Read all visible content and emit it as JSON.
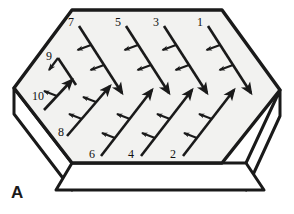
{
  "figure": {
    "panel_label": "A",
    "title": "",
    "shape": "hexagonal slab, 3D perspective",
    "fill_color": "#f2f2f0",
    "outline_color": "#1a1a1a",
    "arrow_color": "#1a1a1a",
    "background_color": "#ffffff"
  },
  "labels": [
    {
      "id": "1",
      "text": "1",
      "x": 200,
      "y": 26,
      "direction": "down-right"
    },
    {
      "id": "2",
      "text": "2",
      "x": 173,
      "y": 158,
      "direction": "up-right"
    },
    {
      "id": "3",
      "text": "3",
      "x": 156,
      "y": 26,
      "direction": "down-right"
    },
    {
      "id": "4",
      "text": "4",
      "x": 131,
      "y": 158,
      "direction": "up-right"
    },
    {
      "id": "5",
      "text": "5",
      "x": 118,
      "y": 26,
      "direction": "down-right"
    },
    {
      "id": "6",
      "text": "6",
      "x": 92,
      "y": 158,
      "direction": "up-right"
    },
    {
      "id": "7",
      "text": "7",
      "x": 71,
      "y": 26,
      "direction": "down-right"
    },
    {
      "id": "8",
      "text": "8",
      "x": 61,
      "y": 133,
      "direction": "up-right"
    },
    {
      "id": "9",
      "text": "9",
      "x": 49,
      "y": 60,
      "direction": "down-right"
    },
    {
      "id": "10",
      "text": "10",
      "x": 38,
      "y": 96,
      "direction": "up-right"
    }
  ],
  "geometry": {
    "top_face": [
      [
        14,
        88
      ],
      [
        72,
        10
      ],
      [
        222,
        10
      ],
      [
        280,
        90
      ],
      [
        222,
        163
      ],
      [
        72,
        163
      ]
    ],
    "slab_depth": 26,
    "bottom_rect": [
      [
        72,
        163
      ],
      [
        246,
        163
      ],
      [
        264,
        190
      ],
      [
        72,
        190
      ]
    ]
  },
  "arrows": {
    "odd_count": 5,
    "even_count": 5,
    "barbs_per_arrow": 3,
    "odd_note": "down-right arrows originating at top edge, labelled 1,3,5,7,9",
    "even_note": "up-right arrows originating at bottom edge, labelled 2,4,6,8,10"
  }
}
